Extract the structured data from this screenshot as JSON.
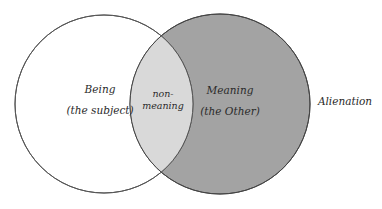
{
  "diagram": {
    "type": "venn",
    "sets": [
      {
        "id": "being",
        "title": "Being",
        "subtitle": "(the subject)",
        "fill": "#ffffff",
        "stroke": "#555555"
      },
      {
        "id": "meaning",
        "title": "Meaning",
        "subtitle": "(the Other)",
        "fill": "#a3a3a3",
        "stroke": "#444444"
      }
    ],
    "intersection": {
      "line1": "non-",
      "line2": "meaning",
      "fill": "#d9d9d9"
    },
    "caption": "Alienation"
  }
}
